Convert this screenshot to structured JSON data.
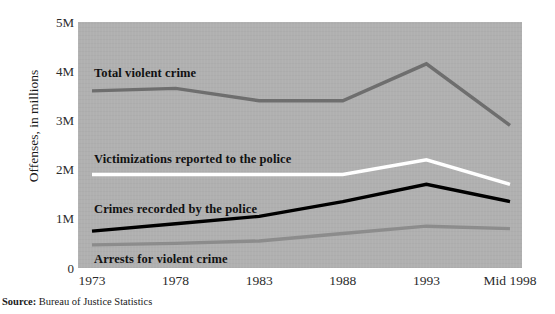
{
  "chart_data": {
    "type": "line",
    "title": "",
    "subtitle": "",
    "xlabel": "",
    "ylabel": "Offenses, in millions",
    "categories": [
      "1973",
      "1978",
      "1983",
      "1988",
      "1993",
      "Mid 1998"
    ],
    "x_tick_labels": [
      "1973",
      "1978",
      "1983",
      "1988",
      "1993",
      "Mid 1998"
    ],
    "y_tick_labels": [
      "5M",
      "4M",
      "3M",
      "2M",
      "1M",
      "0"
    ],
    "y_tick_values": [
      5,
      4,
      3,
      2,
      1,
      0
    ],
    "ylim": [
      0,
      5
    ],
    "grid": false,
    "legend_position": "inline-annotations",
    "series": [
      {
        "name": "Total violent crime",
        "color": "#6e6e6e",
        "label_x": 94,
        "label_y": 66,
        "values": [
          3.6,
          3.65,
          3.4,
          3.4,
          4.15,
          2.9
        ]
      },
      {
        "name": "Victimizations reported to the police",
        "color": "#ffffff",
        "label_x": 94,
        "label_y": 152,
        "values": [
          1.9,
          1.9,
          1.9,
          1.9,
          2.2,
          1.7
        ]
      },
      {
        "name": "Crimes recorded by the police",
        "color": "#000000",
        "label_x": 94,
        "label_y": 202,
        "values": [
          0.75,
          0.9,
          1.05,
          1.35,
          1.7,
          1.35
        ]
      },
      {
        "name": "Arrests for violent crime",
        "color": "#8c8c8c",
        "label_x": 94,
        "label_y": 252,
        "values": [
          0.47,
          0.5,
          0.55,
          0.7,
          0.85,
          0.8
        ]
      }
    ],
    "plot_background_color": "#b0b0b0"
  },
  "source": {
    "label": "Source:",
    "text": "Bureau of Justice Statistics"
  }
}
